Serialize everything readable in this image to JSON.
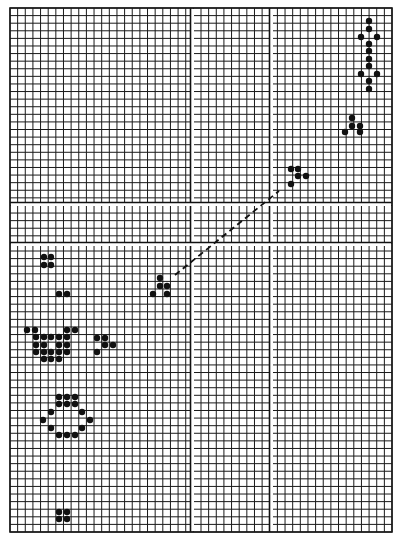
{
  "diagram": {
    "grid": {
      "left": 10,
      "top": 8,
      "right": 392,
      "bottom": 532,
      "cols": 50,
      "rows": 69,
      "line_color": "#1a1a1a",
      "vertical_gaps_x": [
        191,
        270
      ],
      "horizontal_gaps_y": [
        203,
        243
      ]
    },
    "dot_color": "#111111",
    "dot_radius": 3.2,
    "patterns": [
      {
        "name": "vertical-oscillator-top-right",
        "dots": [
          [
            369,
            21
          ],
          [
            369,
            29
          ],
          [
            361,
            37
          ],
          [
            377,
            37
          ],
          [
            369,
            44
          ],
          [
            369,
            51
          ],
          [
            369,
            59
          ],
          [
            369,
            66
          ],
          [
            361,
            74
          ],
          [
            377,
            74
          ],
          [
            369,
            81
          ],
          [
            369,
            89
          ]
        ]
      },
      {
        "name": "glider-top-right",
        "dots": [
          [
            352,
            118
          ],
          [
            352,
            126
          ],
          [
            360,
            126
          ],
          [
            345,
            132
          ],
          [
            360,
            132
          ]
        ]
      },
      {
        "name": "glider-upper",
        "dots": [
          [
            291,
            169
          ],
          [
            298,
            169
          ],
          [
            298,
            176
          ],
          [
            306,
            176
          ],
          [
            291,
            184
          ]
        ]
      },
      {
        "name": "glider-lower",
        "dots": [
          [
            160,
            278
          ],
          [
            160,
            286
          ],
          [
            167,
            286
          ],
          [
            153,
            294
          ],
          [
            167,
            294
          ]
        ]
      },
      {
        "name": "block-left",
        "dots": [
          [
            44,
            257
          ],
          [
            51,
            257
          ],
          [
            44,
            265
          ],
          [
            51,
            265
          ]
        ]
      },
      {
        "name": "pair-left",
        "dots": [
          [
            59,
            294
          ],
          [
            67,
            294
          ]
        ]
      },
      {
        "name": "cluster-left",
        "dots": [
          [
            27,
            330
          ],
          [
            35,
            330
          ],
          [
            67,
            330
          ],
          [
            75,
            330
          ],
          [
            36,
            337
          ],
          [
            44,
            337
          ],
          [
            51,
            337
          ],
          [
            59,
            337
          ],
          [
            67,
            337
          ],
          [
            36,
            345
          ],
          [
            44,
            345
          ],
          [
            59,
            345
          ],
          [
            67,
            345
          ],
          [
            36,
            352
          ],
          [
            44,
            352
          ],
          [
            51,
            352
          ],
          [
            59,
            352
          ],
          [
            67,
            352
          ],
          [
            44,
            359
          ],
          [
            51,
            359
          ],
          [
            59,
            359
          ]
        ]
      },
      {
        "name": "glider-left",
        "dots": [
          [
            97,
            338
          ],
          [
            105,
            338
          ],
          [
            105,
            345
          ],
          [
            113,
            345
          ],
          [
            97,
            352
          ]
        ]
      },
      {
        "name": "ring",
        "dots": [
          [
            59,
            397
          ],
          [
            67,
            397
          ],
          [
            75,
            397
          ],
          [
            59,
            404
          ],
          [
            67,
            404
          ],
          [
            75,
            404
          ],
          [
            51,
            412
          ],
          [
            82,
            412
          ],
          [
            43,
            420
          ],
          [
            90,
            420
          ],
          [
            51,
            428
          ],
          [
            82,
            428
          ],
          [
            59,
            435
          ],
          [
            67,
            435
          ],
          [
            75,
            435
          ]
        ]
      },
      {
        "name": "block-bottom",
        "dots": [
          [
            59,
            512
          ],
          [
            67,
            512
          ],
          [
            59,
            519
          ],
          [
            67,
            519
          ]
        ]
      }
    ],
    "trajectory": {
      "x1": 175,
      "y1": 275,
      "x2": 279,
      "y2": 191,
      "dash": "6 4"
    }
  }
}
